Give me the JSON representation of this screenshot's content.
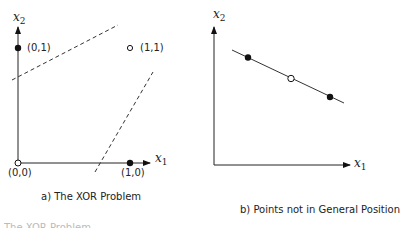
{
  "panel_a": {
    "caption": "a) The XOR Problem",
    "x_axis_label": "x",
    "x_axis_sub": "1",
    "y_axis_label": "x",
    "y_axis_sub": "2",
    "points": [
      {
        "label": "(0,0)",
        "filled": false
      },
      {
        "label": "(0,1)",
        "filled": true
      },
      {
        "label": "(1,0)",
        "filled": true
      },
      {
        "label": "(1,1)",
        "filled": false
      }
    ],
    "separators": "two dashed lines"
  },
  "panel_b": {
    "caption": "b) Points not in General Position",
    "x_axis_label": "x",
    "x_axis_sub": "1",
    "y_axis_label": "x",
    "y_axis_sub": "2",
    "points": [
      {
        "filled": true
      },
      {
        "filled": false
      },
      {
        "filled": true
      }
    ]
  },
  "footer_fragment": "The XOR Problem"
}
